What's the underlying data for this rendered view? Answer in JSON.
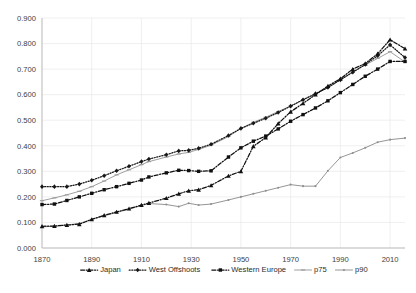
{
  "chart_data": {
    "type": "line",
    "title": "",
    "xlabel": "",
    "ylabel": "",
    "xlim": [
      1870,
      2016
    ],
    "ylim": [
      0.0,
      0.9
    ],
    "grid": true,
    "legend_position": "bottom",
    "xticks": [
      "1870",
      "1890",
      "1910",
      "1930",
      "1950",
      "1970",
      "1990",
      "2010"
    ],
    "xtick_values": [
      1870,
      1890,
      1910,
      1930,
      1950,
      1970,
      1990,
      2010
    ],
    "yticks": [
      "0.000",
      "0.100",
      "0.200",
      "0.300",
      "0.400",
      "0.500",
      "0.600",
      "0.700",
      "0.800",
      "0.900"
    ],
    "ytick_values": [
      0.0,
      0.1,
      0.2,
      0.3,
      0.4,
      0.5,
      0.6,
      0.7,
      0.8,
      0.9
    ],
    "x": [
      1870,
      1875,
      1880,
      1885,
      1890,
      1895,
      1900,
      1905,
      1910,
      1913,
      1920,
      1925,
      1929,
      1933,
      1938,
      1945,
      1950,
      1955,
      1960,
      1965,
      1970,
      1975,
      1980,
      1985,
      1990,
      1995,
      2000,
      2005,
      2010,
      2016
    ],
    "series": [
      {
        "name": "Japan",
        "marker": "triangle",
        "linestyle": "dash-dot",
        "color": "#111111",
        "values": [
          0.085,
          0.086,
          0.09,
          0.093,
          0.112,
          0.128,
          0.141,
          0.154,
          0.168,
          0.176,
          0.195,
          0.212,
          0.224,
          0.228,
          0.245,
          0.282,
          0.3,
          0.398,
          0.432,
          0.487,
          0.533,
          0.566,
          0.6,
          0.634,
          0.662,
          0.7,
          0.722,
          0.76,
          0.815,
          0.78
        ]
      },
      {
        "name": "West Offshoots",
        "marker": "diamond",
        "linestyle": "dotted",
        "color": "#171717",
        "values": [
          0.24,
          0.24,
          0.24,
          0.25,
          0.265,
          0.283,
          0.302,
          0.32,
          0.338,
          0.348,
          0.365,
          0.38,
          0.382,
          0.39,
          0.406,
          0.44,
          0.468,
          0.488,
          0.508,
          0.53,
          0.555,
          0.58,
          0.604,
          0.628,
          0.658,
          0.688,
          0.718,
          0.752,
          0.795,
          0.745
        ]
      },
      {
        "name": "Western Europe",
        "marker": "square",
        "linestyle": "dash-dot",
        "color": "#101010",
        "values": [
          0.17,
          0.172,
          0.186,
          0.2,
          0.214,
          0.228,
          0.24,
          0.253,
          0.266,
          0.278,
          0.294,
          0.304,
          0.303,
          0.3,
          0.302,
          0.356,
          0.392,
          0.418,
          0.438,
          0.466,
          0.496,
          0.522,
          0.548,
          0.576,
          0.608,
          0.64,
          0.672,
          0.7,
          0.73,
          0.73
        ]
      },
      {
        "name": "p75",
        "marker": "dash",
        "linestyle": "solid",
        "color": "#9a9a9a",
        "values": [
          0.185,
          0.196,
          0.208,
          0.222,
          0.24,
          0.262,
          0.286,
          0.306,
          0.326,
          0.338,
          0.356,
          0.368,
          0.374,
          0.386,
          0.402,
          0.436,
          0.468,
          0.492,
          0.512,
          0.534,
          0.556,
          0.58,
          0.602,
          0.628,
          0.658,
          0.688,
          0.716,
          0.742,
          0.768,
          0.728
        ]
      },
      {
        "name": "p90",
        "marker": "dot",
        "linestyle": "solid",
        "color": "#8f8f8f",
        "values": [
          0.083,
          0.085,
          0.09,
          0.096,
          0.112,
          0.126,
          0.139,
          0.152,
          0.166,
          0.174,
          0.17,
          0.162,
          0.175,
          0.168,
          0.172,
          0.188,
          0.2,
          0.212,
          0.224,
          0.236,
          0.248,
          0.242,
          0.242,
          0.302,
          0.354,
          0.372,
          0.392,
          0.414,
          0.424,
          0.43
        ]
      }
    ],
    "legend": [
      {
        "label": "Japan",
        "marker": "triangle",
        "linestyle": "dash-dot",
        "color": "#111111"
      },
      {
        "label": "West Offshoots",
        "marker": "diamond",
        "linestyle": "dotted",
        "color": "#171717"
      },
      {
        "label": "Western Europe",
        "marker": "square",
        "linestyle": "dash-dot",
        "color": "#101010"
      },
      {
        "label": "p75",
        "marker": "dash",
        "linestyle": "solid",
        "color": "#9a9a9a"
      },
      {
        "label": "p90",
        "marker": "dot",
        "linestyle": "solid",
        "color": "#8f8f8f"
      }
    ]
  },
  "caption": {
    "text": ""
  }
}
